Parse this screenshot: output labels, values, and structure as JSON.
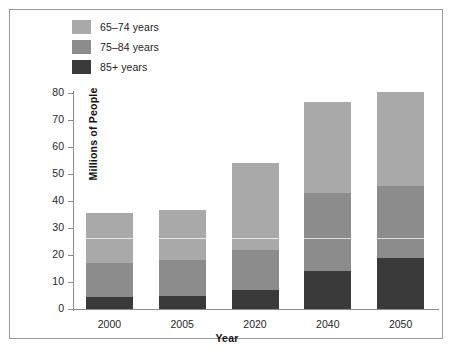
{
  "figure": {
    "background": "#ffffff",
    "frame_color": "#9a9a9a"
  },
  "legend": {
    "position": "top-left",
    "items": [
      {
        "label": "65–74 years",
        "color": "#a9a9a9",
        "key": "65-74"
      },
      {
        "label": "75–84 years",
        "color": "#8c8c8c",
        "key": "75-84"
      },
      {
        "label": "85+ years",
        "color": "#3a3a3a",
        "key": "85+"
      }
    ]
  },
  "axes": {
    "y_title": "Millions of People",
    "x_title": "Year",
    "y_ticks": [
      0,
      10,
      20,
      30,
      40,
      50,
      60,
      70,
      80
    ],
    "y_tick_labels": [
      "0",
      "10",
      "20",
      "30",
      "40",
      "50",
      "60",
      "70",
      "80"
    ],
    "x_tick_labels": [
      "2000",
      "2005",
      "2020",
      "2040",
      "2050"
    ]
  },
  "chart_data": {
    "type": "bar",
    "stacked": true,
    "title": "",
    "xlabel": "Year",
    "ylabel": "Millions of People",
    "categories": [
      "2000",
      "2005",
      "2020",
      "2040",
      "2050"
    ],
    "ylim": [
      0,
      80
    ],
    "ytick_step": 10,
    "grid": false,
    "legend_position": "top-left",
    "series": [
      {
        "name": "85+ years",
        "color": "#3a3a3a",
        "values": [
          4.5,
          5.0,
          7.0,
          14.0,
          19.0
        ]
      },
      {
        "name": "75–84 years",
        "color": "#8c8c8c",
        "values": [
          12.5,
          13.0,
          15.0,
          29.0,
          26.5
        ]
      },
      {
        "name": "65–74 years",
        "color": "#a9a9a9",
        "values": [
          18.5,
          18.5,
          32.0,
          33.5,
          35.0
        ]
      }
    ],
    "totals": [
      35.5,
      36.5,
      54.0,
      76.5,
      80.5
    ]
  }
}
